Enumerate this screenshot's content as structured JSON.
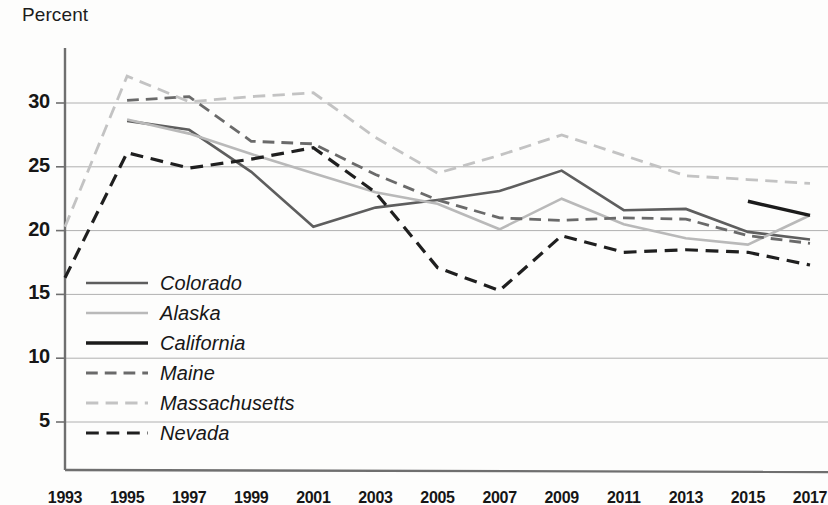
{
  "chart_data": {
    "type": "line",
    "title": "",
    "ylabel": "Percent",
    "xlabel": "",
    "ylim": [
      0,
      32.5
    ],
    "yticks": [
      5,
      10,
      15,
      20,
      25,
      30
    ],
    "grid": true,
    "legend_position": "inside-lower-left",
    "x": [
      1993,
      1995,
      1997,
      1999,
      2001,
      2003,
      2005,
      2007,
      2009,
      2011,
      2013,
      2015,
      2017
    ],
    "xticks": [
      "1993",
      "1995",
      "1997",
      "1999",
      "2001",
      "2003",
      "2005",
      "2007",
      "2009",
      "2011",
      "2013",
      "2015",
      "2017"
    ],
    "series": [
      {
        "name": "Colorado",
        "color": "#5e5e5e",
        "dash": "solid",
        "width": 2.6,
        "x": [
          1995,
          1997,
          1999,
          2001,
          2003,
          2005,
          2007,
          2009,
          2011,
          2013,
          2015,
          2017
        ],
        "values": [
          28.6,
          27.9,
          24.6,
          20.3,
          21.8,
          22.4,
          23.1,
          24.7,
          21.6,
          21.7,
          19.9,
          19.3
        ]
      },
      {
        "name": "Alaska",
        "color": "#b9b9b9",
        "dash": "solid",
        "width": 2.6,
        "x": [
          1995,
          1997,
          1999,
          2001,
          2003,
          2005,
          2007,
          2009,
          2011,
          2013,
          2015,
          2017
        ],
        "values": [
          28.7,
          27.6,
          26.0,
          24.5,
          23.0,
          22.1,
          20.1,
          22.5,
          20.5,
          19.4,
          18.9,
          21.2
        ]
      },
      {
        "name": "California",
        "color": "#1b1b1b",
        "dash": "solid",
        "width": 3.4,
        "x": [
          2015,
          2017
        ],
        "values": [
          22.3,
          21.2
        ]
      },
      {
        "name": "Maine",
        "color": "#6a6a6a",
        "dash": "dashed",
        "width": 2.8,
        "x": [
          1995,
          1997,
          1999,
          2001,
          2003,
          2005,
          2007,
          2009,
          2011,
          2013,
          2015,
          2017
        ],
        "values": [
          30.2,
          30.5,
          27.0,
          26.8,
          24.4,
          22.4,
          21.0,
          20.8,
          21.0,
          20.9,
          19.6,
          19.0
        ]
      },
      {
        "name": "Massachusetts",
        "color": "#c3c3c3",
        "dash": "dashed",
        "width": 2.8,
        "x": [
          1993,
          1995,
          1997,
          1999,
          2001,
          2003,
          2005,
          2007,
          2009,
          2011,
          2013,
          2015,
          2017
        ],
        "values": [
          20.3,
          32.1,
          30.1,
          30.5,
          30.8,
          27.3,
          24.5,
          25.9,
          27.5,
          25.9,
          24.3,
          24.0,
          23.7
        ]
      },
      {
        "name": "Nevada",
        "color": "#1f1f1f",
        "dash": "dashed",
        "width": 3.2,
        "x": [
          1993,
          1995,
          1997,
          1999,
          2001,
          2003,
          2005,
          2007,
          2009,
          2011,
          2013,
          2015,
          2017
        ],
        "values": [
          16.3,
          26.1,
          24.9,
          25.6,
          26.5,
          23.0,
          17.1,
          15.3,
          19.6,
          18.3,
          18.5,
          18.3,
          17.3
        ]
      }
    ]
  },
  "legend": {
    "items": [
      {
        "label": "Colorado"
      },
      {
        "label": "Alaska"
      },
      {
        "label": "California"
      },
      {
        "label": "Maine"
      },
      {
        "label": "Massachusetts"
      },
      {
        "label": "Nevada"
      }
    ]
  },
  "axes": {
    "y_title": "Percent"
  },
  "colors": {
    "axis": "#6f6f6f",
    "grid": "#b0b0b0",
    "text": "#161616"
  }
}
